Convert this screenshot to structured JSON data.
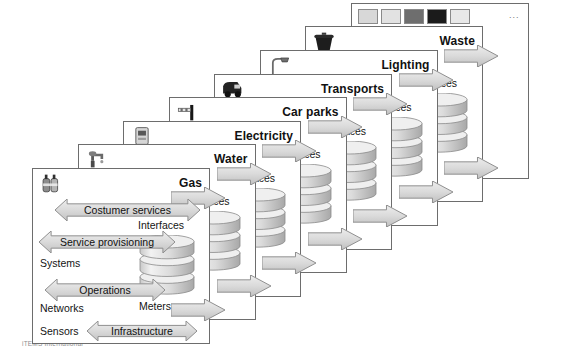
{
  "figure": {
    "caption": "iTEMS International",
    "back_ellipsis": "...",
    "interfaces_label": "Interfaces",
    "meters_label": "Meters"
  },
  "palette": {
    "panel_border": "#6d6d6d",
    "arrow_fill": "#d2d2d2",
    "arrow_stroke": "#8f8f8f",
    "background": "#ffffff",
    "text": "#141414",
    "caption": "#8d8d8d"
  },
  "panels": [
    {
      "title": "Waste",
      "icon": "waste-bin-icon"
    },
    {
      "title": "Lighting",
      "icon": "street-lamp-icon"
    },
    {
      "title": "Transports",
      "icon": "bus-icon"
    },
    {
      "title": "Car parks",
      "icon": "parking-barrier-icon"
    },
    {
      "title": "Electricity",
      "icon": "electric-meter-icon"
    },
    {
      "title": "Water",
      "icon": "faucet-icon"
    },
    {
      "title": "Gas",
      "icon": "gas-cylinder-icon"
    }
  ],
  "back_panel": {
    "thumbnails": [
      "thumbnail-cctv-camera",
      "thumbnail-people",
      "thumbnail-building",
      "thumbnail-dark-scene",
      "thumbnail-pole"
    ]
  },
  "front_panel": {
    "title": "Gas",
    "layers": [
      {
        "label": "Costumer services"
      },
      {
        "label": "Service provisioning"
      },
      {
        "label": "Operations"
      },
      {
        "label": "Infrastructure"
      }
    ],
    "side_labels": [
      {
        "label": "Systems"
      },
      {
        "label": "Networks"
      },
      {
        "label": "Sensors"
      }
    ],
    "interfaces_label": "Interfaces",
    "meters_label": "Meters"
  }
}
